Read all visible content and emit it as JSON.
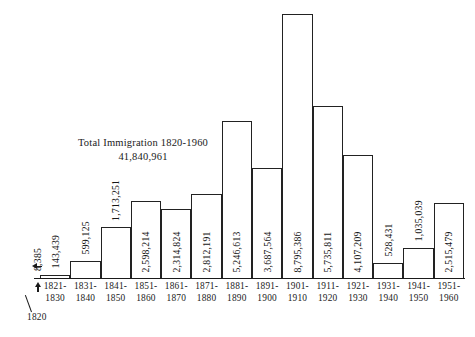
{
  "annotation": {
    "title": "Total Immigration 1820-1960",
    "total": "41,840,961"
  },
  "origin": {
    "label": "1820"
  },
  "chart_data": {
    "type": "bar",
    "title": "Total Immigration 1820-1960",
    "subtitle": "41,840,961",
    "xlabel": "",
    "ylabel": "",
    "ylim": [
      0,
      9000000
    ],
    "grid": false,
    "legend": null,
    "categories": [
      "1820",
      "1821-1830",
      "1831-1840",
      "1841-1850",
      "1851-1860",
      "1861-1870",
      "1871-1880",
      "1881-1890",
      "1891-1900",
      "1901-1910",
      "1911-1920",
      "1921-1930",
      "1931-1940",
      "1941-1950",
      "1951-1960"
    ],
    "tick_labels": [
      [
        "1821-",
        "1830"
      ],
      [
        "1831-",
        "1840"
      ],
      [
        "1841-",
        "1850"
      ],
      [
        "1851-",
        "1860"
      ],
      [
        "1861-",
        "1870"
      ],
      [
        "1871-",
        "1880"
      ],
      [
        "1881-",
        "1890"
      ],
      [
        "1891-",
        "1900"
      ],
      [
        "1901-",
        "1910"
      ],
      [
        "1911-",
        "1920"
      ],
      [
        "1921-",
        "1930"
      ],
      [
        "1931-",
        "1940"
      ],
      [
        "1941-",
        "1950"
      ],
      [
        "1951-",
        "1960"
      ]
    ],
    "values": [
      8385,
      143439,
      599125,
      1713251,
      2598214,
      2314824,
      2812191,
      5246613,
      3687564,
      8795386,
      5735811,
      4107209,
      528431,
      1035039,
      2515479
    ],
    "value_labels": [
      "8,385",
      "143,439",
      "599,125",
      "1,713,251",
      "2,598,214",
      "2,314,824",
      "2,812,191",
      "5,246,613",
      "3,687,564",
      "8,795,386",
      "5,735,811",
      "4,107,209",
      "528,431",
      "1,035,039",
      "2,515,479"
    ]
  }
}
